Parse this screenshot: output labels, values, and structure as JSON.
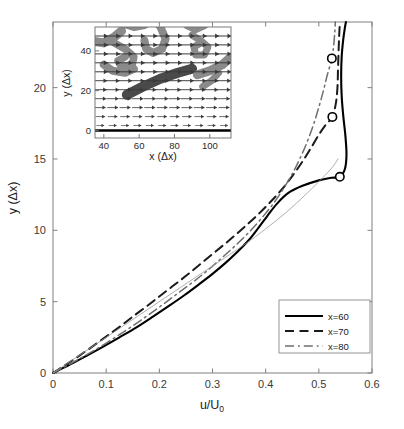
{
  "figure": {
    "background": "#ffffff",
    "axis_color": "#808080",
    "text_color": "#2a2a2a"
  },
  "chart_data": {
    "type": "line",
    "title": "",
    "xlabel": "u/U0",
    "xlabel_parts": {
      "base": "u/U",
      "sub": "0"
    },
    "ylabel": "y (Δx)",
    "xlim": [
      0,
      0.6
    ],
    "ylim": [
      0,
      24.6
    ],
    "xticks": [
      0,
      0.1,
      0.2,
      0.3,
      0.4,
      0.5,
      0.6
    ],
    "xtick_labels": [
      "0",
      "0.1",
      "0.2",
      "0.3",
      "0.4",
      "0.5",
      "0.6"
    ],
    "yticks": [
      0,
      5,
      10,
      15,
      20
    ],
    "ytick_labels": [
      "0",
      "5",
      "10",
      "15",
      "20"
    ],
    "grid": false,
    "legend_position": "lower-right",
    "series": [
      {
        "name": "x=60",
        "style": "solid",
        "color": "#000000",
        "width": 2.1,
        "marker": {
          "shape": "circle",
          "x": 0.5395,
          "y": 13.75
        },
        "points": [
          [
            0.0,
            0.0
          ],
          [
            0.03,
            0.55
          ],
          [
            0.06,
            1.15
          ],
          [
            0.092,
            1.8
          ],
          [
            0.125,
            2.5
          ],
          [
            0.157,
            3.2
          ],
          [
            0.188,
            3.95
          ],
          [
            0.218,
            4.7
          ],
          [
            0.247,
            5.45
          ],
          [
            0.274,
            6.2
          ],
          [
            0.3,
            6.95
          ],
          [
            0.324,
            7.7
          ],
          [
            0.347,
            8.5
          ],
          [
            0.368,
            9.3
          ],
          [
            0.386,
            10.15
          ],
          [
            0.403,
            11.0
          ],
          [
            0.421,
            11.85
          ],
          [
            0.442,
            12.6
          ],
          [
            0.468,
            13.1
          ],
          [
            0.5,
            13.5
          ],
          [
            0.524,
            13.68
          ],
          [
            0.5395,
            13.75
          ],
          [
            0.549,
            14.3
          ],
          [
            0.552,
            15.3
          ],
          [
            0.55,
            16.6
          ],
          [
            0.546,
            18.0
          ],
          [
            0.543,
            19.4
          ],
          [
            0.542,
            20.8
          ],
          [
            0.543,
            22.2
          ],
          [
            0.546,
            23.4
          ],
          [
            0.549,
            24.2
          ],
          [
            0.551,
            24.6
          ]
        ]
      },
      {
        "name": "x=70",
        "style": "dashed",
        "color": "#1a1a1a",
        "width": 2.0,
        "marker": {
          "shape": "circle",
          "x": 0.5255,
          "y": 17.95
        },
        "points": [
          [
            0.0,
            0.0
          ],
          [
            0.023,
            0.55
          ],
          [
            0.047,
            1.15
          ],
          [
            0.072,
            1.8
          ],
          [
            0.098,
            2.5
          ],
          [
            0.124,
            3.2
          ],
          [
            0.15,
            3.95
          ],
          [
            0.177,
            4.7
          ],
          [
            0.203,
            5.45
          ],
          [
            0.229,
            6.2
          ],
          [
            0.255,
            6.95
          ],
          [
            0.281,
            7.75
          ],
          [
            0.307,
            8.55
          ],
          [
            0.333,
            9.35
          ],
          [
            0.359,
            10.2
          ],
          [
            0.384,
            11.05
          ],
          [
            0.408,
            11.95
          ],
          [
            0.43,
            12.85
          ],
          [
            0.45,
            13.8
          ],
          [
            0.468,
            14.75
          ],
          [
            0.484,
            15.7
          ],
          [
            0.5,
            16.7
          ],
          [
            0.513,
            17.4
          ],
          [
            0.5255,
            17.95
          ],
          [
            0.532,
            18.9
          ],
          [
            0.535,
            20.0
          ],
          [
            0.536,
            21.2
          ],
          [
            0.537,
            22.4
          ],
          [
            0.538,
            23.4
          ],
          [
            0.539,
            24.2
          ],
          [
            0.54,
            24.6
          ]
        ]
      },
      {
        "name": "x=80",
        "style": "dashdot",
        "color": "#6e6e6e",
        "width": 1.5,
        "marker": {
          "shape": "circle",
          "x": 0.5245,
          "y": 22.05
        },
        "points": [
          [
            0.0,
            0.0
          ],
          [
            0.028,
            0.55
          ],
          [
            0.057,
            1.15
          ],
          [
            0.087,
            1.8
          ],
          [
            0.117,
            2.5
          ],
          [
            0.146,
            3.2
          ],
          [
            0.175,
            3.95
          ],
          [
            0.203,
            4.7
          ],
          [
            0.23,
            5.45
          ],
          [
            0.257,
            6.2
          ],
          [
            0.283,
            6.95
          ],
          [
            0.308,
            7.75
          ],
          [
            0.332,
            8.55
          ],
          [
            0.355,
            9.35
          ],
          [
            0.377,
            10.2
          ],
          [
            0.398,
            11.1
          ],
          [
            0.417,
            12.0
          ],
          [
            0.434,
            12.95
          ],
          [
            0.45,
            13.95
          ],
          [
            0.464,
            15.0
          ],
          [
            0.477,
            16.1
          ],
          [
            0.489,
            17.3
          ],
          [
            0.499,
            18.5
          ],
          [
            0.508,
            19.7
          ],
          [
            0.516,
            20.9
          ],
          [
            0.5245,
            22.05
          ],
          [
            0.528,
            23.0
          ],
          [
            0.53,
            23.9
          ],
          [
            0.531,
            24.6
          ]
        ]
      },
      {
        "name": "reference",
        "style": "solid-thin",
        "color": "#9a9a9a",
        "width": 0.8,
        "marker": null,
        "points": [
          [
            0.0,
            0.0
          ],
          [
            0.06,
            1.5
          ],
          [
            0.12,
            3.0
          ],
          [
            0.18,
            4.5
          ],
          [
            0.24,
            6.0
          ],
          [
            0.3,
            7.5
          ],
          [
            0.36,
            9.0
          ],
          [
            0.4,
            10.1
          ],
          [
            0.44,
            11.3
          ],
          [
            0.475,
            12.5
          ],
          [
            0.505,
            13.6
          ],
          [
            0.525,
            14.4
          ],
          [
            0.536,
            15.0
          ]
        ]
      }
    ],
    "legend": {
      "entries": [
        {
          "label": "x=60",
          "style": "solid"
        },
        {
          "label": "x=70",
          "style": "dashed"
        },
        {
          "label": "x=80",
          "style": "dashdot"
        }
      ]
    }
  },
  "inset": {
    "type": "quiver",
    "xlabel": "x (Δx)",
    "ylabel": "y (Δx)",
    "xlim": [
      35,
      112
    ],
    "ylim": [
      -2,
      52
    ],
    "xticks": [
      40,
      60,
      80,
      100
    ],
    "xtick_labels": [
      "40",
      "60",
      "80",
      "100"
    ],
    "yticks": [
      0,
      20,
      40
    ],
    "ytick_labels": [
      "0",
      "20",
      "40"
    ],
    "wall_line": {
      "y": 0,
      "color": "#000000",
      "width": 2.4
    },
    "arrow_color": "#3a3a3a",
    "blob_color_light": "#8a8a8a",
    "blob_color_dark": "#4a4a4a",
    "blob_edge": "#6a6a6a"
  }
}
